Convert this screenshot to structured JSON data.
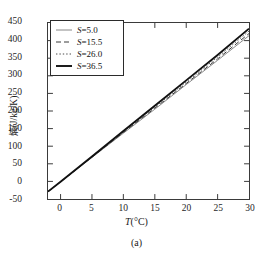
{
  "chart_data": {
    "type": "line",
    "title": "",
    "caption": "(a)",
    "xlabel": "T(°C)",
    "xlabel_symbol": "T",
    "xlabel_unit": "(°C)",
    "ylabel": "熵(J/kg/K)",
    "ylabel_symbol": "熵",
    "ylabel_unit": "(J/kg/K)",
    "xlim": [
      -2,
      30
    ],
    "ylim": [
      -50,
      450
    ],
    "xticks": [
      0,
      5,
      10,
      15,
      20,
      25,
      30
    ],
    "yticks": [
      -50,
      0,
      50,
      100,
      150,
      200,
      250,
      300,
      350,
      400,
      450
    ],
    "grid": false,
    "legend_position": "upper-left",
    "x": [
      -2,
      0,
      5,
      10,
      15,
      20,
      25,
      30
    ],
    "series": [
      {
        "name": "S=5.0",
        "label_symbol": "S",
        "label_value": "5.0",
        "style": "thin-solid",
        "color": "#7a7a7a",
        "width": 0.9,
        "dash": "none",
        "values": [
          -29,
          -1,
          68,
          137,
          205,
          275,
          344,
          414
        ]
      },
      {
        "name": "S=15.5",
        "label_symbol": "S",
        "label_value": "15.5",
        "style": "dashed",
        "color": "#3a3a3a",
        "width": 1.0,
        "dash": "5,3",
        "values": [
          -29,
          -1,
          69,
          139,
          208,
          278,
          348,
          420
        ]
      },
      {
        "name": "S=26.0",
        "label_symbol": "S",
        "label_value": "26.0",
        "style": "dotted",
        "color": "#4a4a4a",
        "width": 1.0,
        "dash": "1.4,2",
        "values": [
          -29,
          -1,
          70,
          141,
          211,
          282,
          353,
          427
        ]
      },
      {
        "name": "S=36.5",
        "label_symbol": "S",
        "label_value": "36.5",
        "style": "thick-solid",
        "color": "#111111",
        "width": 1.9,
        "dash": "none",
        "values": [
          -29,
          -1,
          71,
          143,
          215,
          287,
          359,
          434
        ]
      }
    ]
  }
}
